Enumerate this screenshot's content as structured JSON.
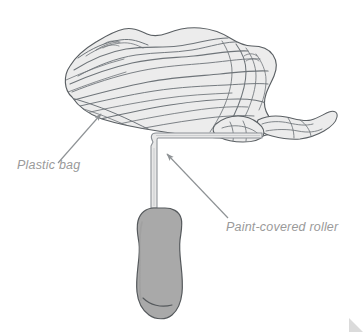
{
  "figure": {
    "type": "line-illustration",
    "background_color": "#ffffff"
  },
  "labels": {
    "plastic_bag": "Plastic bag",
    "paint_roller": "Paint-covered roller"
  },
  "colors": {
    "label_text": "#9a9a9a",
    "outline": "#5a5f63",
    "bag_fill": "#ececec",
    "wrinkle_line": "#6e7479",
    "handle_fill": "#a9a9a9",
    "handle_outline": "#55595c",
    "wire_fill": "#e8e8e8",
    "wire_outline": "#8b9095",
    "arrow": "#8e9295",
    "corner_artifact": "#cfcfcf"
  },
  "parts": {
    "plastic_bag": "crumpled-plastic-bag",
    "roller_frame": "roller-wire-frame",
    "roller_handle": "roller-grip-handle"
  },
  "annotations": [
    {
      "name": "plastic-bag-callout",
      "text": "Plastic bag",
      "arrow_from": [
        58,
        163
      ],
      "arrow_to": [
        101,
        114
      ]
    },
    {
      "name": "paint-roller-callout",
      "text": "Paint-covered roller",
      "arrow_from": [
        228,
        218
      ],
      "arrow_to": [
        167,
        154
      ]
    }
  ]
}
